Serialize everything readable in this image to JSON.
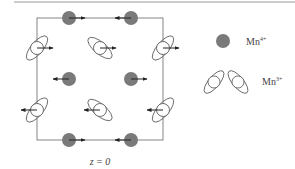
{
  "figure": {
    "caption_label": "z = 0",
    "colors": {
      "mn4_fill": "#7a7a7a",
      "outline": "#555555",
      "arrow": "#222222",
      "frame": "#666666"
    }
  },
  "legend": {
    "items": [
      {
        "name": "mn4",
        "base": "Mn",
        "charge": "4+"
      },
      {
        "name": "mn3",
        "base": "Mn",
        "charge": "3+"
      }
    ]
  },
  "lattice": {
    "mn4_sites": [
      {
        "x": 69,
        "y": 18,
        "spin": "right"
      },
      {
        "x": 131,
        "y": 18,
        "spin": "left"
      },
      {
        "x": 69,
        "y": 79,
        "spin": "left"
      },
      {
        "x": 131,
        "y": 79,
        "spin": "right"
      },
      {
        "x": 69,
        "y": 140,
        "spin": "right"
      },
      {
        "x": 131,
        "y": 140,
        "spin": "left"
      }
    ],
    "mn3_sites": [
      {
        "x": 37,
        "y": 48,
        "orbital": "tilt-left",
        "spin": "right"
      },
      {
        "x": 100,
        "y": 48,
        "orbital": "tilt-right",
        "spin": "right"
      },
      {
        "x": 163,
        "y": 48,
        "orbital": "tilt-left",
        "spin": "right"
      },
      {
        "x": 37,
        "y": 110,
        "orbital": "tilt-left",
        "spin": "left"
      },
      {
        "x": 100,
        "y": 110,
        "orbital": "tilt-right",
        "spin": "left"
      },
      {
        "x": 163,
        "y": 110,
        "orbital": "tilt-left",
        "spin": "left"
      }
    ]
  }
}
